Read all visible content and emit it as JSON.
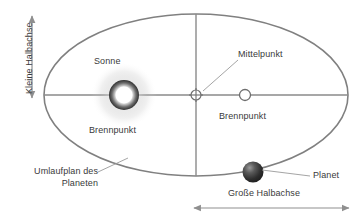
{
  "diagram": {
    "labels": {
      "minor_axis": "Kleine Halbachse",
      "major_axis": "Große Halbachse",
      "sun": "Sonne",
      "focus_left": "Brennpunkt",
      "focus_right": "Brennpunkt",
      "center": "Mittelpunkt",
      "orbit_line1": "Umlaufplan des",
      "orbit_line2": "Planeten",
      "planet": "Planet"
    },
    "colors": {
      "background": "#ffffff",
      "orbit_stroke": "#808080",
      "axis_stroke": "#8a8a8a",
      "text": "#3a3a3a",
      "leader_line": "#9a9a9a",
      "arrow": "#8f8f8f",
      "sun_core": "#ffffff",
      "sun_ring": "#3c3c3c",
      "planet_dark": "#2b2b2b",
      "planet_light": "#8c8c8c",
      "focus_fill": "#ffffff"
    },
    "geometry": {
      "ellipse_center_x": 196,
      "ellipse_center_y": 95,
      "ellipse_rx": 152,
      "ellipse_ry": 81,
      "sun_x": 124,
      "sun_y": 95,
      "sun_r": 15,
      "center_point_x": 196,
      "center_point_y": 95,
      "focus_right_x": 245,
      "focus_right_y": 95,
      "planet_x": 253,
      "planet_y": 172,
      "planet_r": 10
    },
    "icons": {
      "sun": "sun-glow-icon",
      "planet": "planet-sphere-icon",
      "center": "crossed-circle-icon",
      "focus": "open-circle-icon",
      "minor_arrow": "double-arrow-vertical-icon",
      "major_arrow": "double-arrow-horizontal-icon"
    }
  }
}
